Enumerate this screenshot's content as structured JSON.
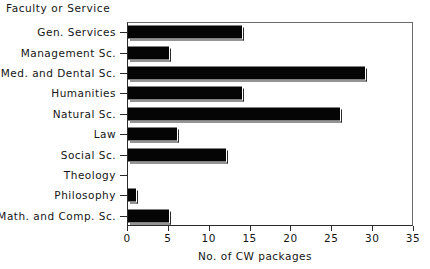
{
  "chart_data": {
    "type": "bar",
    "orientation": "horizontal",
    "title": "",
    "ylabel": "Faculty or Service",
    "xlabel": "No. of CW packages",
    "xlim": [
      0,
      35
    ],
    "xticks": [
      0,
      5,
      10,
      15,
      20,
      25,
      30,
      35
    ],
    "grid": false,
    "legend": null,
    "categories": [
      "Gen. Services",
      "Management Sc.",
      "Med. and Dental Sc.",
      "Humanities",
      "Natural Sc.",
      "Law",
      "Social Sc.",
      "Theology",
      "Philosophy",
      "Math. and Comp. Sc."
    ],
    "values": [
      14,
      5,
      29,
      14,
      26,
      6,
      12,
      0,
      1,
      5
    ],
    "bar_color": "#050505",
    "axis_color": "#2a2a2a"
  }
}
